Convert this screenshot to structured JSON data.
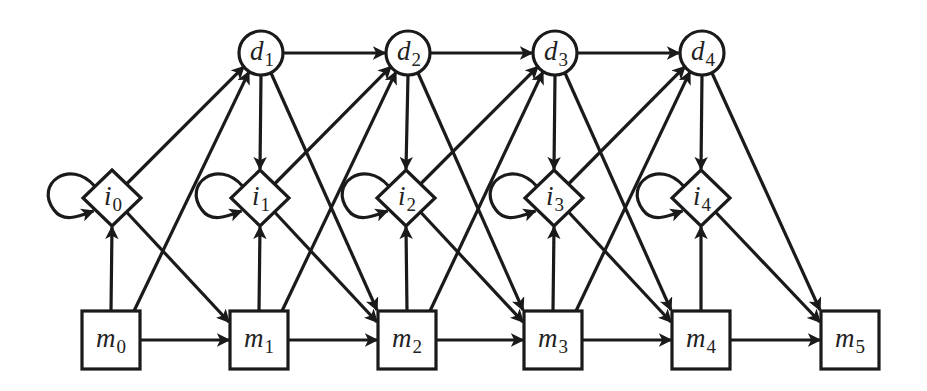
{
  "diagram": {
    "type": "directed-graph",
    "colors": {
      "stroke": "#1a1a1a",
      "fill": "#ffffff",
      "text": "#222222",
      "background": "#ffffff"
    },
    "nodes": [
      {
        "id": "d1",
        "base": "d",
        "sub": "1",
        "shape": "circle",
        "x": 261,
        "y": 53
      },
      {
        "id": "d2",
        "base": "d",
        "sub": "2",
        "shape": "circle",
        "x": 408,
        "y": 53
      },
      {
        "id": "d3",
        "base": "d",
        "sub": "3",
        "shape": "circle",
        "x": 555,
        "y": 53
      },
      {
        "id": "d4",
        "base": "d",
        "sub": "4",
        "shape": "circle",
        "x": 702,
        "y": 53
      },
      {
        "id": "i0",
        "base": "i",
        "sub": "0",
        "shape": "diamond",
        "x": 112,
        "y": 198
      },
      {
        "id": "i1",
        "base": "i",
        "sub": "1",
        "shape": "diamond",
        "x": 260,
        "y": 198
      },
      {
        "id": "i2",
        "base": "i",
        "sub": "2",
        "shape": "diamond",
        "x": 406,
        "y": 198
      },
      {
        "id": "i3",
        "base": "i",
        "sub": "3",
        "shape": "diamond",
        "x": 554,
        "y": 198
      },
      {
        "id": "i4",
        "base": "i",
        "sub": "4",
        "shape": "diamond",
        "x": 701,
        "y": 198
      },
      {
        "id": "m0",
        "base": "m",
        "sub": "0",
        "shape": "square",
        "x": 111,
        "y": 340
      },
      {
        "id": "m1",
        "base": "m",
        "sub": "1",
        "shape": "square",
        "x": 259,
        "y": 340
      },
      {
        "id": "m2",
        "base": "m",
        "sub": "2",
        "shape": "square",
        "x": 407,
        "y": 340
      },
      {
        "id": "m3",
        "base": "m",
        "sub": "3",
        "shape": "square",
        "x": 553,
        "y": 340
      },
      {
        "id": "m4",
        "base": "m",
        "sub": "4",
        "shape": "square",
        "x": 701,
        "y": 340
      },
      {
        "id": "m5",
        "base": "m",
        "sub": "5",
        "shape": "square",
        "x": 850,
        "y": 340
      }
    ],
    "edges": [
      [
        "d1",
        "d2"
      ],
      [
        "d2",
        "d3"
      ],
      [
        "d3",
        "d4"
      ],
      [
        "d1",
        "i1"
      ],
      [
        "d2",
        "i2"
      ],
      [
        "d3",
        "i3"
      ],
      [
        "d4",
        "i4"
      ],
      [
        "d1",
        "m2"
      ],
      [
        "d2",
        "m3"
      ],
      [
        "d3",
        "m4"
      ],
      [
        "d4",
        "m5"
      ],
      [
        "i0",
        "d1"
      ],
      [
        "i1",
        "d2"
      ],
      [
        "i2",
        "d3"
      ],
      [
        "i3",
        "d4"
      ],
      [
        "i0",
        "m1"
      ],
      [
        "i1",
        "m2"
      ],
      [
        "i2",
        "m3"
      ],
      [
        "i3",
        "m4"
      ],
      [
        "i4",
        "m5"
      ],
      [
        "i0",
        "i0"
      ],
      [
        "i1",
        "i1"
      ],
      [
        "i2",
        "i2"
      ],
      [
        "i3",
        "i3"
      ],
      [
        "i4",
        "i4"
      ],
      [
        "m0",
        "i0"
      ],
      [
        "m1",
        "i1"
      ],
      [
        "m2",
        "i2"
      ],
      [
        "m3",
        "i3"
      ],
      [
        "m4",
        "i4"
      ],
      [
        "m0",
        "d1"
      ],
      [
        "m1",
        "d2"
      ],
      [
        "m2",
        "d3"
      ],
      [
        "m3",
        "d4"
      ],
      [
        "m0",
        "m1"
      ],
      [
        "m1",
        "m2"
      ],
      [
        "m2",
        "m3"
      ],
      [
        "m3",
        "m4"
      ],
      [
        "m4",
        "m5"
      ]
    ]
  },
  "labels": {
    "d1": {
      "base": "d",
      "sub": "1"
    },
    "d2": {
      "base": "d",
      "sub": "2"
    },
    "d3": {
      "base": "d",
      "sub": "3"
    },
    "d4": {
      "base": "d",
      "sub": "4"
    },
    "i0": {
      "base": "i",
      "sub": "0"
    },
    "i1": {
      "base": "i",
      "sub": "1"
    },
    "i2": {
      "base": "i",
      "sub": "2"
    },
    "i3": {
      "base": "i",
      "sub": "3"
    },
    "i4": {
      "base": "i",
      "sub": "4"
    },
    "m0": {
      "base": "m",
      "sub": "0"
    },
    "m1": {
      "base": "m",
      "sub": "1"
    },
    "m2": {
      "base": "m",
      "sub": "2"
    },
    "m3": {
      "base": "m",
      "sub": "3"
    },
    "m4": {
      "base": "m",
      "sub": "4"
    },
    "m5": {
      "base": "m",
      "sub": "5"
    }
  }
}
